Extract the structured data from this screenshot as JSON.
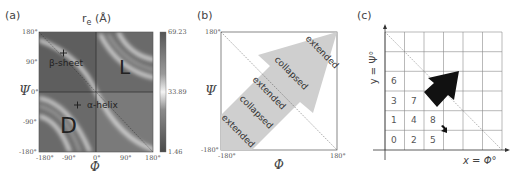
{
  "panel_a": {
    "label": "(a)",
    "title": "r_e (Å)",
    "title_main": "r",
    "title_sub": "e",
    "title_unit": " (Å)",
    "x_symbol": "Φ",
    "y_symbol": "Ψ",
    "x_ticks": [
      "-180°",
      "-90°",
      "0°",
      "90°",
      "180°"
    ],
    "y_ticks": [
      "180°",
      "90°",
      "0°",
      "-90°",
      "-180°"
    ],
    "colorbar": {
      "max": "69.23",
      "mid": "33.89",
      "min": "1.46"
    },
    "annotations": {
      "beta_sheet": "β-sheet",
      "alpha_helix": "α-helix",
      "L": "L",
      "D": "D"
    }
  },
  "panel_b": {
    "label": "(b)",
    "x_symbol": "Φ",
    "y_symbol": "Ψ",
    "x_ticks": [
      "-180°",
      "180°"
    ],
    "y_ticks": [
      "180°",
      "-180°"
    ],
    "arrow_labels": [
      "extended",
      "collapsed",
      "extended",
      "collapsed",
      "extended"
    ]
  },
  "panel_c": {
    "label": "(c)",
    "x_axis_label": "x = Φ°",
    "y_axis_label": "y = Ψ°",
    "cells": [
      {
        "text": "0",
        "col": 0,
        "row": 0
      },
      {
        "text": "2",
        "col": 1,
        "row": 0
      },
      {
        "text": "5",
        "col": 2,
        "row": 0
      },
      {
        "text": "1",
        "col": 0,
        "row": 1
      },
      {
        "text": "4",
        "col": 1,
        "row": 1
      },
      {
        "text": "8",
        "col": 2,
        "row": 1
      },
      {
        "text": "3",
        "col": 0,
        "row": 2
      },
      {
        "text": "7",
        "col": 1,
        "row": 2
      },
      {
        "text": "6",
        "col": 0,
        "row": 3
      }
    ],
    "grid_size": 6
  },
  "colors": {
    "arrow_b": "#cfcfcf",
    "arrow_c": "#111111",
    "grid": "#888888",
    "diagonal": "#666666"
  }
}
